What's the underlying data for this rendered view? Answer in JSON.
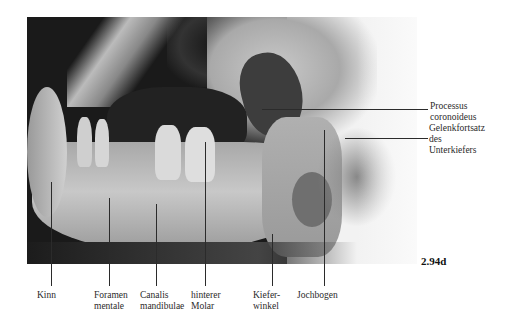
{
  "figure": {
    "number": "2.94d",
    "image_description": "Röntgenaufnahme des Unterkiefers (seitlich)"
  },
  "labels_bottom": [
    {
      "id": "kinn",
      "lines": [
        "Kinn"
      ]
    },
    {
      "id": "foramen-mentale",
      "lines": [
        "Foramen",
        "mentale"
      ]
    },
    {
      "id": "canalis-mandibulae",
      "lines": [
        "Canalis",
        "mandibulae"
      ]
    },
    {
      "id": "hinterer-molar",
      "lines": [
        "hinterer",
        "Molar"
      ]
    },
    {
      "id": "kieferwinkel",
      "lines": [
        "Kiefer-",
        "winkel"
      ]
    },
    {
      "id": "jochbogen",
      "lines": [
        "Jochbogen"
      ]
    }
  ],
  "labels_right": [
    {
      "id": "processus-coronoideus",
      "lines": [
        "Processus",
        "coronoideus"
      ]
    },
    {
      "id": "gelenkfortsatz",
      "lines": [
        "Gelenkfortsatz",
        "des",
        "Unterkiefers"
      ]
    }
  ]
}
